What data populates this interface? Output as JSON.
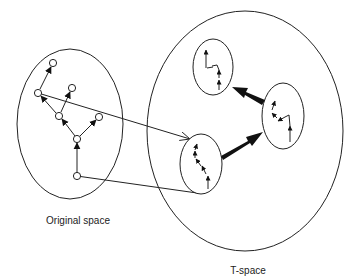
{
  "labels": {
    "original_space": "Original space",
    "t_space": "T-space"
  },
  "colors": {
    "stroke": "#222222",
    "background": "#ffffff"
  },
  "original_space": {
    "ellipse": {
      "cx": 70,
      "cy": 124,
      "rx": 53,
      "ry": 75
    },
    "nodes": [
      {
        "id": "top",
        "x": 53,
        "y": 63
      },
      {
        "id": "left",
        "x": 38,
        "y": 93
      },
      {
        "id": "upper-right",
        "x": 72,
        "y": 88
      },
      {
        "id": "middle",
        "x": 59,
        "y": 116
      },
      {
        "id": "right",
        "x": 99,
        "y": 117
      },
      {
        "id": "junction",
        "x": 77,
        "y": 139
      },
      {
        "id": "bottom",
        "x": 77,
        "y": 176
      }
    ],
    "edges": [
      {
        "from": "bottom",
        "to": "junction"
      },
      {
        "from": "junction",
        "to": "middle"
      },
      {
        "from": "junction",
        "to": "right"
      },
      {
        "from": "middle",
        "to": "left"
      },
      {
        "from": "middle",
        "to": "upper-right"
      },
      {
        "from": "left",
        "to": "top"
      }
    ]
  },
  "t_space": {
    "ellipse": {
      "cx": 245,
      "cy": 131,
      "rx": 98,
      "ry": 120
    },
    "clusters": [
      {
        "id": "bottom-left",
        "cx": 201,
        "cy": 164,
        "rx": 21,
        "ry": 30
      },
      {
        "id": "right",
        "cx": 283,
        "cy": 116,
        "rx": 21,
        "ry": 33
      },
      {
        "id": "top",
        "cx": 213,
        "cy": 67,
        "rx": 20,
        "ry": 28
      }
    ],
    "thick_arrows": [
      {
        "from": "bottom-left",
        "to": "right"
      },
      {
        "from": "right",
        "to": "top"
      }
    ]
  },
  "mappings": [
    {
      "from_node": "left",
      "to_cluster": "bottom-left",
      "arrow": true
    },
    {
      "from_node": "bottom",
      "to_cluster": "bottom-left",
      "arrow": false
    }
  ]
}
